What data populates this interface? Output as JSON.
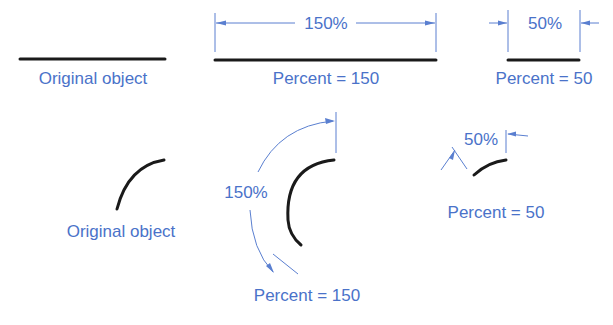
{
  "colors": {
    "label": "#4a72c9",
    "dimension": "#5a7fd0",
    "object": "#1a1a1a"
  },
  "linear": {
    "original": {
      "label": "Original object"
    },
    "percent150": {
      "dimension_text": "150%",
      "label": "Percent = 150"
    },
    "percent50": {
      "dimension_text": "50%",
      "label": "Percent = 50"
    }
  },
  "arc": {
    "original": {
      "label": "Original object"
    },
    "percent150": {
      "dimension_text": "150%",
      "label": "Percent = 150"
    },
    "percent50": {
      "dimension_text": "50%",
      "label": "Percent = 50"
    }
  }
}
